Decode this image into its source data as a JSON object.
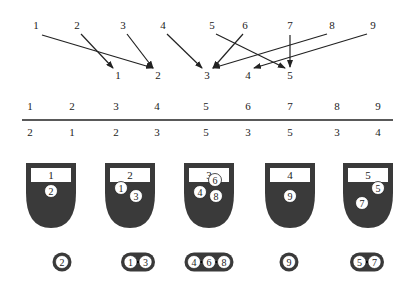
{
  "mapping": {
    "keys": [
      "1",
      "2",
      "3",
      "4",
      "5",
      "6",
      "7",
      "8",
      "9"
    ],
    "targets": [
      "1",
      "2",
      "3",
      "4",
      "5"
    ],
    "arrows": [
      {
        "from": "1",
        "to": "2"
      },
      {
        "from": "2",
        "to": "1"
      },
      {
        "from": "3",
        "to": "2"
      },
      {
        "from": "4",
        "to": "3"
      },
      {
        "from": "5",
        "to": "5"
      },
      {
        "from": "6",
        "to": "3"
      },
      {
        "from": "7",
        "to": "5"
      },
      {
        "from": "8",
        "to": "3"
      },
      {
        "from": "9",
        "to": "4"
      }
    ]
  },
  "table": {
    "keys": [
      "1",
      "2",
      "3",
      "4",
      "5",
      "6",
      "7",
      "8",
      "9"
    ],
    "values": [
      "2",
      "1",
      "2",
      "3",
      "5",
      "3",
      "5",
      "3",
      "4"
    ]
  },
  "buckets": [
    {
      "label": "1",
      "items": [
        "2"
      ]
    },
    {
      "label": "2",
      "items": [
        "1",
        "3"
      ]
    },
    {
      "label": "3",
      "items": [
        "6",
        "4",
        "8"
      ]
    },
    {
      "label": "4",
      "items": [
        "9"
      ]
    },
    {
      "label": "5",
      "items": [
        "5",
        "7"
      ]
    }
  ],
  "chains": [
    {
      "items": [
        "2"
      ]
    },
    {
      "items": [
        "1",
        "3"
      ]
    },
    {
      "items": [
        "4",
        "6",
        "8"
      ]
    },
    {
      "items": [
        "9"
      ]
    },
    {
      "items": [
        "5",
        "7"
      ]
    }
  ],
  "colors": {
    "bucket_fill": "#3a3a3a",
    "label_box": "#ffffff",
    "ink": "#222222"
  }
}
